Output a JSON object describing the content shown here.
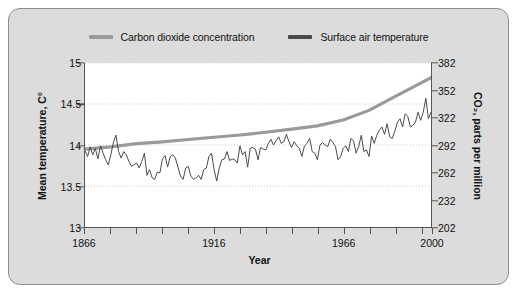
{
  "figure": {
    "background_color": "#dcdcdc",
    "border_color": "#8d8d8d",
    "plot_background": "#ffffff"
  },
  "chart_data": {
    "type": "line",
    "title": "",
    "xlabel": "Year",
    "ylabel": "Mean temperature, C°",
    "y2label": "CO₂, parts per million",
    "xlim": [
      1866,
      2000
    ],
    "ylim": [
      13,
      15
    ],
    "y2lim": [
      202,
      382
    ],
    "grid": true,
    "grid_style": "dotted-horizontal",
    "legend_position": "top-center",
    "xticks": [
      1866,
      1876,
      1886,
      1896,
      1906,
      1916,
      1926,
      1936,
      1946,
      1956,
      1966,
      1976,
      1986,
      1996,
      2000
    ],
    "xtick_labels_shown": [
      "1866",
      "1916",
      "1966",
      "2000"
    ],
    "yticks": [
      13,
      13.5,
      14,
      14.5,
      15
    ],
    "ytick_labels": [
      "13",
      "13.5",
      "14",
      "14.5",
      "15"
    ],
    "y2ticks": [
      202,
      232,
      262,
      292,
      322,
      352,
      382
    ],
    "y2tick_labels": [
      "202",
      "232",
      "262",
      "292",
      "322",
      "352",
      "382"
    ],
    "series": [
      {
        "name": "Carbon dioxide concentration",
        "color": "#9a9a9a",
        "axis": "right",
        "units": "parts per million",
        "x": [
          1866,
          1876,
          1886,
          1896,
          1906,
          1916,
          1926,
          1936,
          1946,
          1956,
          1966,
          1976,
          1986,
          1996,
          2000
        ],
        "values": [
          287.5,
          290.0,
          293.5,
          295.5,
          298.0,
          300.5,
          303.0,
          306.0,
          309.5,
          313.0,
          319.5,
          330.0,
          345.0,
          360.0,
          366.0
        ]
      },
      {
        "name": "Surface air temperature",
        "color": "#4a4a4a",
        "axis": "left",
        "units": "C°",
        "x": [
          1866,
          1867,
          1868,
          1869,
          1870,
          1871,
          1872,
          1873,
          1874,
          1875,
          1876,
          1877,
          1878,
          1879,
          1880,
          1881,
          1882,
          1883,
          1884,
          1885,
          1886,
          1887,
          1888,
          1889,
          1890,
          1891,
          1892,
          1893,
          1894,
          1895,
          1896,
          1897,
          1898,
          1899,
          1900,
          1901,
          1902,
          1903,
          1904,
          1905,
          1906,
          1907,
          1908,
          1909,
          1910,
          1911,
          1912,
          1913,
          1914,
          1915,
          1916,
          1917,
          1918,
          1919,
          1920,
          1921,
          1922,
          1923,
          1924,
          1925,
          1926,
          1927,
          1928,
          1929,
          1930,
          1931,
          1932,
          1933,
          1934,
          1935,
          1936,
          1937,
          1938,
          1939,
          1940,
          1941,
          1942,
          1943,
          1944,
          1945,
          1946,
          1947,
          1948,
          1949,
          1950,
          1951,
          1952,
          1953,
          1954,
          1955,
          1956,
          1957,
          1958,
          1959,
          1960,
          1961,
          1962,
          1963,
          1964,
          1965,
          1966,
          1967,
          1968,
          1969,
          1970,
          1971,
          1972,
          1973,
          1974,
          1975,
          1976,
          1977,
          1978,
          1979,
          1980,
          1981,
          1982,
          1983,
          1984,
          1985,
          1986,
          1987,
          1988,
          1989,
          1990,
          1991,
          1992,
          1993,
          1994,
          1995,
          1996,
          1997,
          1998,
          1999,
          2000
        ],
        "values": [
          13.93,
          13.86,
          13.98,
          13.88,
          13.96,
          13.83,
          13.99,
          13.9,
          13.82,
          13.76,
          13.88,
          14.03,
          14.12,
          13.92,
          13.84,
          13.92,
          13.88,
          13.8,
          13.74,
          13.76,
          13.78,
          13.72,
          13.8,
          13.9,
          13.63,
          13.7,
          13.6,
          13.58,
          13.67,
          13.66,
          13.83,
          13.87,
          13.73,
          13.86,
          13.88,
          13.84,
          13.73,
          13.62,
          13.58,
          13.72,
          13.74,
          13.62,
          13.58,
          13.6,
          13.63,
          13.58,
          13.7,
          13.72,
          13.86,
          13.9,
          13.7,
          13.56,
          13.72,
          13.82,
          13.83,
          13.92,
          13.81,
          13.83,
          13.82,
          13.78,
          13.99,
          13.88,
          13.92,
          13.73,
          13.96,
          13.97,
          13.95,
          13.82,
          13.97,
          13.95,
          13.94,
          14.02,
          14.07,
          14.0,
          14.05,
          14.1,
          14.02,
          14.04,
          14.13,
          14.04,
          13.97,
          14.04,
          13.99,
          13.96,
          13.86,
          13.99,
          14.02,
          14.08,
          13.92,
          13.9,
          13.82,
          14.0,
          14.03,
          14.0,
          13.98,
          14.07,
          14.03,
          13.98,
          13.82,
          13.86,
          13.96,
          13.99,
          13.92,
          14.08,
          14.05,
          13.9,
          13.98,
          14.12,
          13.92,
          13.94,
          13.86,
          14.11,
          14.02,
          14.12,
          14.18,
          14.22,
          14.13,
          14.26,
          14.1,
          14.08,
          14.17,
          14.28,
          14.32,
          14.22,
          14.38,
          14.35,
          14.22,
          14.24,
          14.28,
          14.4,
          14.3,
          14.4,
          14.57,
          14.32,
          14.4
        ]
      }
    ]
  },
  "legend": {
    "items": [
      {
        "label": "Carbon dioxide concentration",
        "color": "#9a9a9a"
      },
      {
        "label": "Surface air temperature",
        "color": "#4a4a4a"
      }
    ]
  },
  "axes": {
    "x_title": "Year",
    "y_left_title": "Mean temperature, C°",
    "y_right_title": "CO₂, parts per million",
    "x_labels": [
      "1866",
      "1916",
      "1966",
      "2000"
    ],
    "y_left_labels": [
      "15",
      "14.5",
      "14",
      "13.5",
      "13"
    ],
    "y_right_labels": [
      "382",
      "352",
      "322",
      "292",
      "262",
      "232",
      "202"
    ]
  }
}
